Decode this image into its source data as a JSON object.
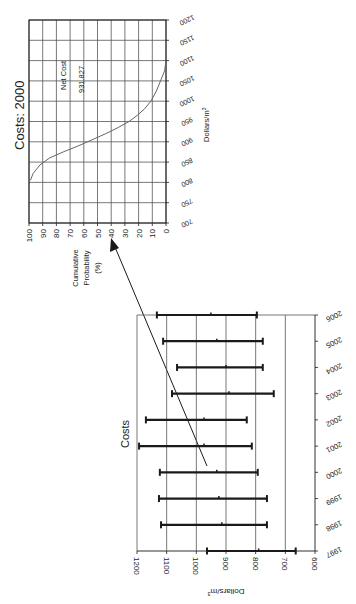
{
  "figure": {
    "ink_color": "#1a1a1a",
    "grid_color": "#555555",
    "curve_color": "#666666",
    "background": "#ffffff"
  },
  "chart_data": [
    {
      "type": "line",
      "title": "Costs: 2000",
      "xlabel": "Dollars/m³",
      "ylabel": "Cumulative Probability (%)",
      "annotation": {
        "label": "Net Cost",
        "value": "931.827"
      },
      "x_ticks": [
        "700",
        "750",
        "800",
        "850",
        "900",
        "950",
        "1000",
        "1050",
        "1100",
        "1150",
        "1200"
      ],
      "y_ticks": [
        "100",
        "90",
        "80",
        "70",
        "60",
        "50",
        "40",
        "30",
        "20",
        "10",
        "0"
      ],
      "xlim": [
        700,
        1200
      ],
      "ylim": [
        0,
        100
      ],
      "grid": true,
      "series": [
        {
          "name": "Cumulative Probability",
          "x": [
            805,
            822,
            843,
            860,
            875,
            890,
            905,
            920,
            935,
            950,
            965,
            980,
            1000,
            1025,
            1050,
            1075,
            1100
          ],
          "y": [
            99,
            97,
            92,
            85,
            75,
            64,
            54,
            44,
            35,
            27,
            21,
            16,
            11,
            7,
            4,
            1,
            0
          ]
        }
      ]
    },
    {
      "type": "errorbar",
      "title": "Costs",
      "xlabel": "",
      "ylabel": "Dollars/m³",
      "categories": [
        "1997",
        "1998",
        "1999",
        "2000",
        "2001",
        "2002",
        "2003",
        "2004",
        "2005",
        "2006"
      ],
      "y_ticks": [
        "1200",
        "1100",
        "1000",
        "900",
        "800",
        "700",
        "600"
      ],
      "ylim": [
        600,
        1200
      ],
      "grid": true,
      "series": [
        {
          "name": "High",
          "values": [
            964,
            1119,
            1126,
            1123,
            1193,
            1170,
            1082,
            1065,
            1112,
            1133
          ]
        },
        {
          "name": "Mid",
          "values": [
            790,
            914,
            924,
            931,
            974,
            974,
            890,
            900,
            931,
            951
          ]
        },
        {
          "name": "Low",
          "values": [
            665,
            762,
            762,
            793,
            813,
            830,
            739,
            776,
            776,
            796
          ]
        }
      ]
    }
  ],
  "labels": {
    "top_title": "Costs: 2000",
    "top_xlabel": "Dollars/m",
    "top_xlabel_sup": "3",
    "top_ylabel_line1": "Cumulative",
    "top_ylabel_line2": "Probability",
    "top_ylabel_line3": "(%)",
    "net_cost_label": "Net Cost",
    "net_cost_value": "931.827",
    "bottom_title": "Costs",
    "bottom_ylabel": "Dollars/m",
    "bottom_ylabel_sup": "3"
  }
}
